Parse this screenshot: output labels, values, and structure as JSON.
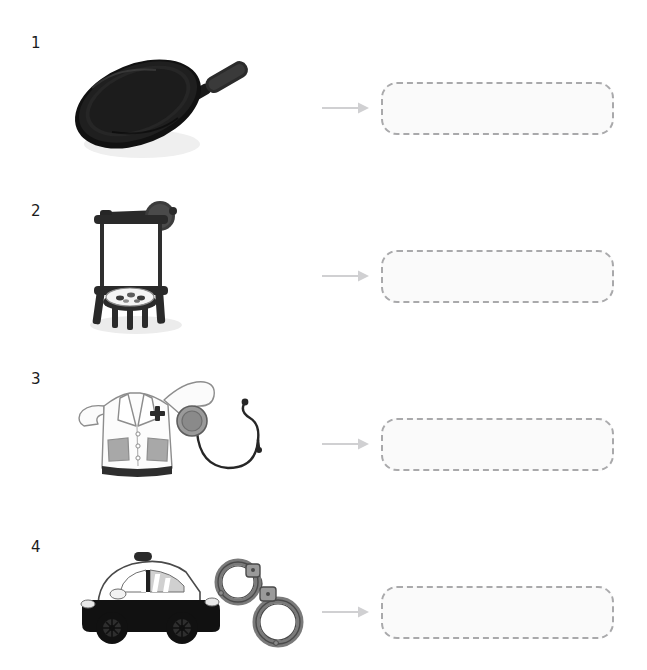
{
  "worksheet": {
    "title": "Jobs and tools matching worksheet",
    "background_color": "#ffffff",
    "rows": [
      {
        "number": "1",
        "illustration_name": "frying-pan-illustration",
        "illustration_items": [
          "frying pan"
        ],
        "arrow_name": "arrow-right-icon",
        "answer_box_name": "answer-box",
        "answer_box_value": "",
        "answer_box_placeholder": ""
      },
      {
        "number": "2",
        "illustration_name": "easel-illustration",
        "illustration_items": [
          "easel",
          "canvas",
          "lamp",
          "stool",
          "paint palette"
        ],
        "arrow_name": "arrow-right-icon",
        "answer_box_name": "answer-box",
        "answer_box_value": "",
        "answer_box_placeholder": ""
      },
      {
        "number": "3",
        "illustration_name": "lab-coat-and-stethoscope-illustration",
        "illustration_items": [
          "lab coat",
          "stethoscope"
        ],
        "arrow_name": "arrow-right-icon",
        "answer_box_name": "answer-box",
        "answer_box_value": "",
        "answer_box_placeholder": ""
      },
      {
        "number": "4",
        "illustration_name": "police-car-and-handcuffs-illustration",
        "illustration_items": [
          "police car",
          "handcuffs"
        ],
        "arrow_name": "arrow-right-icon",
        "answer_box_name": "answer-box",
        "answer_box_value": "",
        "answer_box_placeholder": ""
      }
    ],
    "colors": {
      "number_text": "#1b1b1b",
      "arrow": "#d0d0d2",
      "answer_box_border": "#a9a9ab",
      "answer_box_fill": "#fafafa",
      "dark_object": "#1a1a1a",
      "mid_gray": "#8d8d8d",
      "light_gray": "#d9d9d9",
      "outline_gray": "#6e6e6e",
      "white_object": "#ffffff",
      "shadow": "#e6e6e6"
    }
  }
}
